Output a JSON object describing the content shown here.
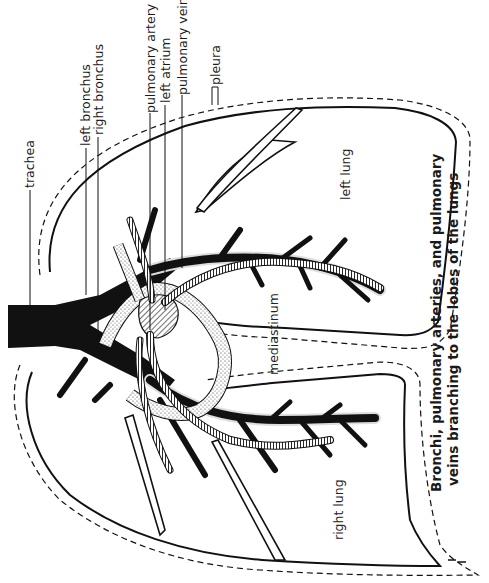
{
  "diagram": {
    "title_line1": "Bronchi, pulmonary arteries, and pulmonary",
    "title_line2": "veins branching to the lobes of the lungs",
    "orientation": "rotated 90° counter-clockwise",
    "labels": {
      "trachea": "trachea",
      "left_bronchus": "left bronchus",
      "right_bronchus": "right bronchus",
      "pulmonary_artery": "pulmonary artery",
      "left_atrium": "left atrium",
      "pulmonary_vein": "pulmonary vein",
      "pleura": "pleura"
    },
    "regions": {
      "left_lung": "left lung",
      "right_lung": "right lung",
      "mediastinum": "mediastinum"
    },
    "colors": {
      "ink": "#111111",
      "paper": "#ffffff",
      "stipple": "#e6e6e6"
    }
  }
}
